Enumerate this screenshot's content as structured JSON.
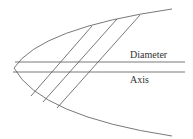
{
  "diagram": {
    "labels": {
      "diameter": "Diameter",
      "axis": "Axis"
    },
    "colors": {
      "stroke": "#555555",
      "text": "#333333",
      "background": "#ffffff"
    }
  }
}
